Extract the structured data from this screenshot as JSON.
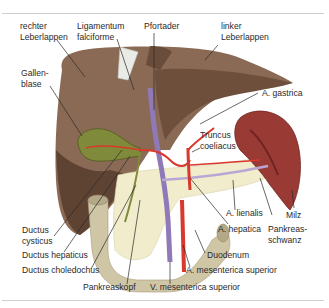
{
  "figure": {
    "labels": {
      "rechter_leberlappen": [
        "rechter",
        "Leberlappen"
      ],
      "ligamentum_falciforme": [
        "Ligamentum",
        "falciforme"
      ],
      "pfortader": "Pfortader",
      "linker_leberlappen": [
        "linker",
        "Leberlappen"
      ],
      "gallenblase": [
        "Gallen-",
        "blase"
      ],
      "a_gastrica": "A. gastrica",
      "truncus_coeliacus": [
        "Truncus",
        "coeliacus"
      ],
      "ductus_cysticus": [
        "Ductus",
        "cysticus"
      ],
      "ductus_hepaticus": "Ductus hepaticus",
      "ductus_choledochus": "Ductus choledochus",
      "pankreaskopf": "Pankreaskopf",
      "v_mesenterica_superior": "V. mesenterica superior",
      "a_mesenterica_superior": "A. mesenterica superior",
      "duodenum": "Duodenum",
      "a_hepatica": "A. hepatica",
      "a_lienalis": "A. lienalis",
      "pankreasschwanz": [
        "Pankreas-",
        "schwanz"
      ],
      "milz": "Milz"
    },
    "colors": {
      "liver": "#8a6a55",
      "liver_dark": "#5e4232",
      "gallbladder": "#7f8a3a",
      "artery": "#d9382c",
      "vein": "#8f79b8",
      "pancreas": "#f1eccb",
      "duodenum": "#cfc6a6",
      "spleen": "#9a3a35",
      "leader_line": "#2a2a2a",
      "rule": "#cfcfcf"
    }
  }
}
